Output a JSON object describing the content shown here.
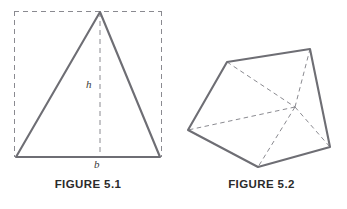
{
  "page": {
    "background_color": "#ffffff",
    "width": 347,
    "height": 209
  },
  "style": {
    "solid_line_color": "#6e6e74",
    "dashed_line_color": "#8a8a90",
    "caption_color": "#2b2b2b",
    "label_color": "#3a3a3a",
    "solid_line_width": 2.1,
    "dashed_line_width": 1.0
  },
  "figures": [
    {
      "id": "figure-5-1",
      "caption": "FIGURE 5.1",
      "description": "isosceles triangle inscribed in a dashed rectangle with height h and base b",
      "labels": {
        "height": "h",
        "base": "b"
      },
      "geometry": {
        "triangle": {
          "apex": [
            100,
            12
          ],
          "bottom_left": [
            16,
            157
          ],
          "bottom_right": [
            160,
            157
          ]
        },
        "dashed_rectangle": {
          "left": 14,
          "top": 11,
          "right": 162,
          "bottom": 157
        },
        "dashed_altitude": {
          "from": [
            100,
            12
          ],
          "to": [
            100,
            157
          ]
        }
      }
    },
    {
      "id": "figure-5-2",
      "caption": "FIGURE 5.2",
      "description": "triangular prism drawn in oblique view with hidden edges shown dashed",
      "geometry": {
        "vertices": {
          "near_top_left": [
            51,
            62
          ],
          "far_top_right": [
            134,
            49
          ],
          "near_left": [
            12,
            130
          ],
          "near_bottom": [
            82,
            167
          ],
          "far_right": [
            154,
            147
          ],
          "hidden_back": [
            119,
            107
          ]
        },
        "solid_edges": [
          [
            "near_top_left",
            "far_top_right"
          ],
          [
            "near_top_left",
            "near_left"
          ],
          [
            "near_left",
            "near_bottom"
          ],
          [
            "near_bottom",
            "far_right"
          ],
          [
            "far_right",
            "far_top_right"
          ]
        ],
        "dashed_edges": [
          [
            "near_top_left",
            "hidden_back"
          ],
          [
            "hidden_back",
            "near_left"
          ],
          [
            "hidden_back",
            "near_bottom"
          ],
          [
            "hidden_back",
            "far_right"
          ],
          [
            "hidden_back",
            "far_top_right"
          ],
          [
            "near_left",
            "far_right"
          ]
        ]
      }
    }
  ]
}
